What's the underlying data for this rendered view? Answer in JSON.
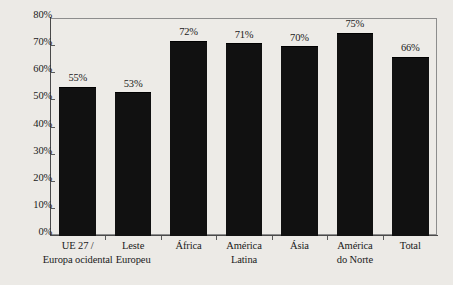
{
  "chart_data": {
    "type": "bar",
    "title": "",
    "subtitle": "",
    "xlabel": "",
    "ylabel": "",
    "ylim": [
      0,
      80
    ],
    "grid": false,
    "legend": false,
    "value_suffix": "%",
    "categories": [
      "UE 27 / Europa ocidental",
      "Leste Europeu",
      "África",
      "América Latina",
      "Ásia",
      "América do Norte",
      "Total"
    ],
    "category_lines": [
      [
        "UE 27 /",
        "Europa ocidental"
      ],
      [
        "Leste",
        "Europeu"
      ],
      [
        "África",
        ""
      ],
      [
        "América",
        "Latina"
      ],
      [
        "Ásia",
        ""
      ],
      [
        "América",
        "do Norte"
      ],
      [
        "Total",
        ""
      ]
    ],
    "values": [
      55,
      53,
      72,
      71,
      70,
      75,
      66
    ],
    "value_labels": [
      "55%",
      "53%",
      "72%",
      "71%",
      "70%",
      "75%",
      "66%"
    ],
    "yticks": [
      0,
      10,
      20,
      30,
      40,
      50,
      60,
      70,
      80
    ],
    "ytick_labels": [
      "0%",
      "10%",
      "20%",
      "30%",
      "40%",
      "50%",
      "60%",
      "70%",
      "80%"
    ],
    "bar_color": "#111111",
    "background_color": "#eceae6",
    "axis_color": "#4a4a4a",
    "frame_color": "#8d8d8d"
  }
}
